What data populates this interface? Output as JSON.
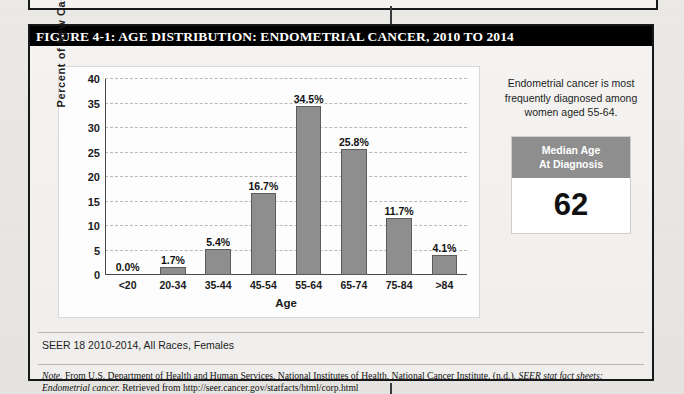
{
  "figure": {
    "title": "FIGURE 4-1: AGE DISTRIBUTION: ENDOMETRIAL CANCER, 2010 TO 2014",
    "source_line": "SEER 18 2010-2014, All Races, Females",
    "note_label": "Note.",
    "note_text_1": " From U.S. Department of Health and Human Services, National Institutes of Health, National Cancer Institute. (n.d.). ",
    "note_italic_1": "SEER stat fact sheets:",
    "note_italic_2": "Endometrial cancer.",
    "note_text_2": " Retrieved from http://seer.cancer.gov/statfacts/html/corp.html"
  },
  "side_panel": {
    "callout": "Endometrial cancer is most frequently diagnosed among women aged 55-64.",
    "median_heading_line1": "Median Age",
    "median_heading_line2": "At Diagnosis",
    "median_value": "62"
  },
  "colors": {
    "bar_fill": "#8e8e8e",
    "bar_stroke": "#5c5c5c",
    "title_bar": "#000000",
    "median_header": "#8e8e8e"
  },
  "chart_data": {
    "type": "bar",
    "title": "",
    "xlabel": "Age",
    "ylabel": "Percent of New Cases",
    "categories": [
      "<20",
      "20-34",
      "35-44",
      "45-54",
      "55-64",
      "65-74",
      "75-84",
      ">84"
    ],
    "values": [
      0.0,
      1.7,
      5.4,
      16.7,
      34.5,
      25.8,
      11.7,
      4.1
    ],
    "data_labels": [
      "0.0%",
      "1.7%",
      "5.4%",
      "16.7%",
      "34.5%",
      "25.8%",
      "11.7%",
      "4.1%"
    ],
    "ylim": [
      0,
      40
    ],
    "yticks": [
      0,
      5,
      10,
      15,
      20,
      25,
      30,
      35,
      40
    ],
    "ytick_labels": [
      "0",
      "5",
      "10",
      "15",
      "20",
      "25",
      "30",
      "35",
      "40"
    ],
    "grid": true,
    "legend": false
  }
}
